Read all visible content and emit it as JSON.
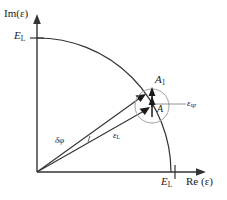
{
  "figure": {
    "type": "diagram",
    "width": 227,
    "height": 200,
    "background": "#ffffff",
    "line_color": "#333333",
    "accent_color": "#8a8a8a"
  },
  "axes": {
    "vertical": {
      "label": "Im(ε)",
      "tick_label": "E",
      "tick_sub": "L",
      "origin_px": [
        37,
        172
      ],
      "end_px": [
        37,
        18
      ],
      "tick_value_px": [
        37,
        38
      ]
    },
    "horizontal": {
      "label_prefix": "Re (",
      "label": "Re (ε)",
      "tick_label": "E",
      "tick_sub": "L",
      "origin_px": [
        37,
        172
      ],
      "end_px": [
        205,
        172
      ],
      "tick_value_px": [
        175,
        172
      ]
    }
  },
  "arc": {
    "name": "saturation-amplitude-arc",
    "center_px": [
      37,
      172
    ],
    "radius_px": 138,
    "start_px": [
      37,
      38
    ],
    "end_px": [
      175,
      172
    ],
    "description": "quarter circle of constant field amplitude E_L"
  },
  "vectors": [
    {
      "name": "field-vector-upper",
      "label": "",
      "from_px": [
        37,
        172
      ],
      "to_px": [
        143,
        96
      ]
    },
    {
      "name": "field-vector-lower",
      "label": "ε",
      "label_sub": "L",
      "from_px": [
        37,
        172
      ],
      "to_px": [
        148,
        109
      ]
    }
  ],
  "labels": {
    "im_axis": "Im(ε)",
    "re_axis": "Re (ε)",
    "e_l_vertical": "E",
    "e_l_vertical_sub": "L",
    "e_l_horizontal": "E",
    "e_l_horizontal_sub": "L",
    "amplitude_a1": "A",
    "amplitude_a1_sub": "1",
    "amplitude_a": "A",
    "epsilon_sp": "ε",
    "epsilon_sp_sub": "sp",
    "epsilon_l": "ε",
    "epsilon_l_sub": "L",
    "delta_phi": "δφ"
  },
  "detail_circle": {
    "name": "spontaneous-emission-circle",
    "center_px": [
      152,
      106
    ],
    "radius_px": 17,
    "stroke": "#9a9a9a"
  },
  "detail_arrows": [
    {
      "name": "arrow-a1",
      "from_px": [
        152,
        106
      ],
      "to_px": [
        152,
        89
      ],
      "label": "A₁"
    },
    {
      "name": "arrow-a",
      "from_px": [
        152,
        112
      ],
      "to_px": [
        152,
        97
      ],
      "label": "A"
    }
  ],
  "leader_line": {
    "name": "epsilon-sp-leader",
    "from_px": [
      152,
      104
    ],
    "to_px": [
      186,
      104
    ]
  }
}
